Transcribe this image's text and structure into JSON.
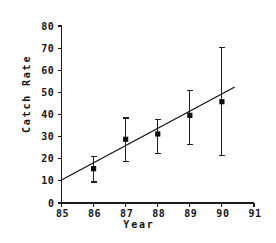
{
  "chart_data": {
    "type": "scatter",
    "title": "",
    "xlabel": "Year",
    "ylabel": "Catch Rate",
    "xlim": [
      85,
      91
    ],
    "ylim": [
      0,
      80
    ],
    "xticks": [
      85,
      86,
      87,
      88,
      89,
      90,
      91
    ],
    "xtick_labels": [
      "85",
      "86",
      "87",
      "88",
      "89",
      "90",
      "91"
    ],
    "yticks": [
      0,
      10,
      20,
      30,
      40,
      50,
      60,
      70,
      80
    ],
    "ytick_labels": [
      "0",
      "10",
      "20",
      "30",
      "40",
      "50",
      "60",
      "70",
      "80"
    ],
    "grid": false,
    "legend": null,
    "x": [
      86,
      87,
      88,
      89,
      90
    ],
    "values": [
      15.5,
      28.8,
      31.2,
      39.6,
      45.8
    ],
    "error_low": [
      9.5,
      18.6,
      22.5,
      26.6,
      21.6
    ],
    "error_high": [
      21.0,
      38.4,
      37.6,
      50.8,
      70.2
    ],
    "series": [
      {
        "name": "Catch Rate",
        "marker": "filled-square",
        "values": [
          15.5,
          28.8,
          31.2,
          39.6,
          45.8
        ]
      },
      {
        "name": "Linear fit",
        "type": "line",
        "x": [
          85.0,
          90.4
        ],
        "values": [
          10.4,
          52.4
        ]
      }
    ],
    "points": [
      {
        "year": "86",
        "value": 15.5,
        "low": 9.5,
        "high": 21.0
      },
      {
        "year": "87",
        "value": 28.8,
        "low": 18.6,
        "high": 38.4
      },
      {
        "year": "88",
        "value": 31.2,
        "low": 22.5,
        "high": 37.6
      },
      {
        "year": "89",
        "value": 39.6,
        "low": 26.6,
        "high": 50.8
      },
      {
        "year": "90",
        "value": 45.8,
        "low": 21.6,
        "high": 70.2
      }
    ],
    "colors": {
      "marker": "#0d0d0d",
      "error_bar": "#202020",
      "fit_line": "#101010",
      "axis": "#1a1a1a",
      "text": "#151515",
      "background": "#ffffff"
    }
  }
}
